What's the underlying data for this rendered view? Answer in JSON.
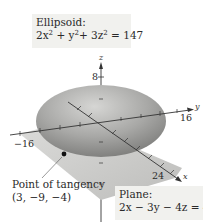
{
  "ellipsoid": {
    "title": "Ellipsoid:",
    "equation_parts": {
      "a": "2x",
      "b": " + y",
      "c": "+ 3z",
      "rhs": " = 147"
    },
    "equation_text": "2x² + y²+ 3z² = 147"
  },
  "plane": {
    "title": "Plane:",
    "equation": "2x − 3y − 4z = 49"
  },
  "point": {
    "label": "Point of tangency",
    "coords": "(3, −9, −4)"
  },
  "axes": {
    "z": {
      "name": "z",
      "tick": "8"
    },
    "y": {
      "name": "y",
      "tick_pos": "16",
      "tick_neg": "−16"
    },
    "x": {
      "name": "x",
      "tick": "24"
    }
  },
  "colors": {
    "ellipsoid_fill": "#9a9a9a",
    "plane_fill": "#c8c8c8",
    "label_bg": "#f1f1ee",
    "axis": "#333333"
  }
}
